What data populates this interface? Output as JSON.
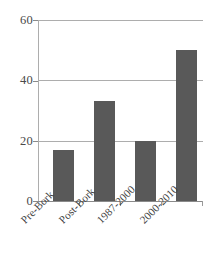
{
  "chart_data": {
    "type": "bar",
    "title": "",
    "xlabel": "",
    "ylabel": "",
    "categories": [
      "Pre-Bork",
      "Post-Bork",
      "1987-2000",
      "2000-2010"
    ],
    "values": [
      17,
      33,
      20,
      50
    ],
    "ylim": [
      0,
      60
    ],
    "yticks": [
      0,
      20,
      40,
      60
    ],
    "ytick_labels": [
      "0",
      "20",
      "40",
      "60"
    ],
    "grid": true,
    "legend": false,
    "legend_position": "none",
    "series": [
      {
        "name": "",
        "values": [
          17,
          33,
          20,
          50
        ]
      }
    ],
    "colors": {
      "bar": "#595959",
      "gridline": "#adadad",
      "axis": "#8a8a8a",
      "text": "#3f3f3f",
      "background": "#ffffff"
    }
  }
}
